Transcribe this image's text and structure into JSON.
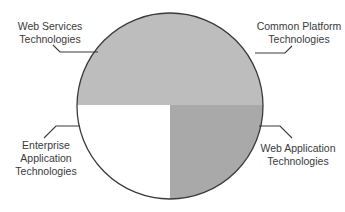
{
  "diagram": {
    "type": "quadrant-circle",
    "segments": [
      {
        "id": "web-services",
        "label_lines": [
          "Web Services",
          "Technologies"
        ],
        "region": "top-left half",
        "fill": "#bdbdbd"
      },
      {
        "id": "common-platform",
        "label_lines": [
          "Common Platform",
          "Technologies"
        ],
        "region": "top-right half",
        "fill": "#bdbdbd"
      },
      {
        "id": "enterprise-application",
        "label_lines": [
          "Enterprise",
          "Application",
          "Technologies"
        ],
        "region": "bottom-left quadrant",
        "fill": "#ffffff"
      },
      {
        "id": "web-application",
        "label_lines": [
          "Web Application",
          "Technologies"
        ],
        "region": "bottom-right quadrant",
        "fill": "#a9a9a9"
      }
    ],
    "colors": {
      "top_half": "#bdbdbd",
      "bottom_right": "#a9a9a9",
      "bottom_left": "#ffffff",
      "outline": "#3a3a3a",
      "leader_line": "#3a3a3a",
      "text": "#3a3a3a"
    }
  }
}
